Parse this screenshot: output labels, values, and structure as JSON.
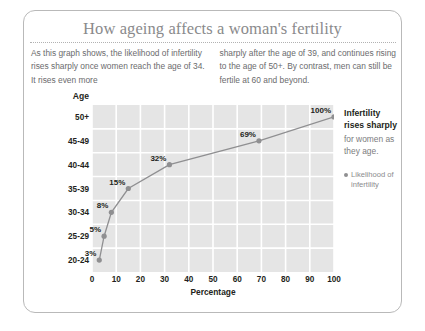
{
  "card": {
    "title": "How ageing affects a woman's fertility",
    "intro_left": "As this graph shows, the likelihood of infertility rises sharply once women reach the age of 34. It rises even more",
    "intro_right": "sharply after the age of 39, and continues rising to the age of 50+. By contrast, men can still be fertile at 60 and beyond."
  },
  "sidebar": {
    "headline": "Infertility rises sharply",
    "subtext": "for women as they age.",
    "legend_label": "Likelihood of infertility",
    "legend_marker": "dot-icon"
  },
  "colors": {
    "plot_background": "#e5e5e5",
    "gridline": "#ffffff",
    "line": "#8f8f91",
    "marker": "#8f8f91",
    "title": "#8a8a8c",
    "label": "#231f20",
    "card_border": "#b9b9b9"
  },
  "chart_data": {
    "type": "line",
    "title": "How ageing affects a woman's fertility",
    "xlabel": "Percentage",
    "ylabel": "Age",
    "grid": true,
    "legend_position": "right",
    "xlim": [
      0,
      100
    ],
    "xticks": [
      "0",
      "10",
      "20",
      "30",
      "40",
      "50",
      "60",
      "70",
      "80",
      "90",
      "100"
    ],
    "xtick_values": [
      0,
      10,
      20,
      30,
      40,
      50,
      60,
      70,
      80,
      90,
      100
    ],
    "categories": [
      "20-24",
      "25-29",
      "30-34",
      "35-39",
      "40-44",
      "45-49",
      "50+"
    ],
    "series": [
      {
        "name": "Likelihood of infertility",
        "values": [
          3,
          5,
          8,
          15,
          32,
          69,
          100
        ],
        "point_labels": [
          "3%",
          "5%",
          "8%",
          "15%",
          "32%",
          "69%",
          "100%"
        ]
      }
    ]
  }
}
